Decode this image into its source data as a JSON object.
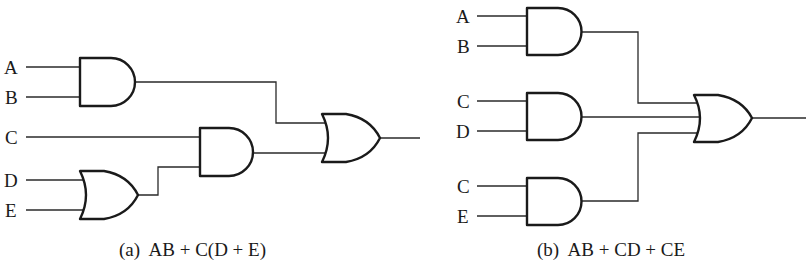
{
  "diagrams": [
    {
      "id": "a",
      "caption": "(a)  AB + C(D + E)",
      "inputs": [
        "A",
        "B",
        "C",
        "D",
        "E"
      ],
      "gates": [
        {
          "type": "AND",
          "inputs": [
            "A",
            "B"
          ]
        },
        {
          "type": "OR",
          "inputs": [
            "D",
            "E"
          ]
        },
        {
          "type": "AND",
          "inputs": [
            "C",
            "D+E"
          ]
        },
        {
          "type": "OR",
          "inputs": [
            "AB",
            "C(D+E)"
          ]
        }
      ]
    },
    {
      "id": "b",
      "caption": "(b)  AB + CD + CE",
      "inputs": [
        "A",
        "B",
        "C",
        "D",
        "C",
        "E"
      ],
      "gates": [
        {
          "type": "AND",
          "inputs": [
            "A",
            "B"
          ]
        },
        {
          "type": "AND",
          "inputs": [
            "C",
            "D"
          ]
        },
        {
          "type": "AND",
          "inputs": [
            "C",
            "E"
          ]
        },
        {
          "type": "OR",
          "inputs": [
            "AB",
            "CD",
            "CE"
          ]
        }
      ]
    }
  ]
}
